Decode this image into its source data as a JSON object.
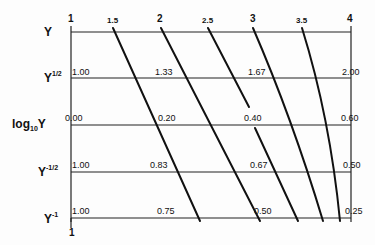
{
  "diagram": {
    "type": "nomograph",
    "row_labels": {
      "y": "Y",
      "sqrt_base": "Y",
      "sqrt_exp": "1/2",
      "log_prefix": "log",
      "log_sub": "10",
      "log_base": "Y",
      "invsqrt_base": "Y",
      "invsqrt_exp": "-1/2",
      "inv_base": "Y",
      "inv_exp": "-1"
    },
    "top_scale": [
      "1",
      "1.5",
      "2",
      "2.5",
      "3",
      "3.5",
      "4"
    ],
    "bottom_label": "1",
    "rows": [
      {
        "name": "Y",
        "values": []
      },
      {
        "name": "Y^(1/2)",
        "values": [
          "1.00",
          "1.33",
          "1.67",
          "2.00"
        ]
      },
      {
        "name": "log10 Y",
        "values": [
          "0.00",
          "0.20",
          "0.40",
          "0.60"
        ]
      },
      {
        "name": "Y^(-1/2)",
        "values": [
          "1.00",
          "0.83",
          "0.67",
          "0.50"
        ]
      },
      {
        "name": "Y^(-1)",
        "values": [
          "1.00",
          "0.75",
          "0.50",
          "0.25"
        ]
      }
    ],
    "line_color": "#111111",
    "background": "#fdfdfd"
  }
}
